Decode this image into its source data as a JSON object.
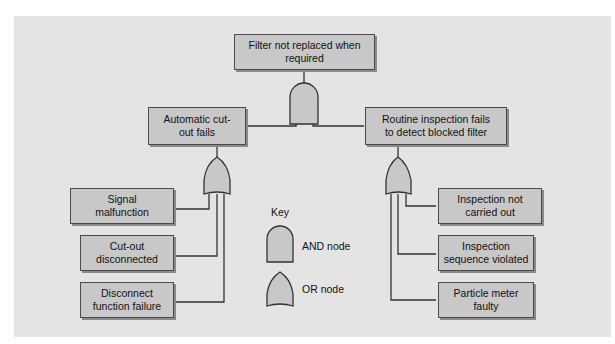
{
  "diagram": {
    "type": "fault-tree",
    "colors": {
      "background": "#e4e4e4",
      "node_fill": "#c8c8c8",
      "gate_fill": "#c8c8c8",
      "line": "#333333"
    },
    "top_event": {
      "label": "Filter not replaced when required",
      "line1": "Filter not replaced when",
      "line2": "required",
      "gate": "AND"
    },
    "intermediate_events": [
      {
        "label": "Automatic cut-out fails",
        "line1": "Automatic cut-",
        "line2": "out fails",
        "gate": "OR",
        "children": [
          {
            "label": "Signal malfunction",
            "line1": "Signal",
            "line2": "malfunction"
          },
          {
            "label": "Cut-out disconnected",
            "line1": "Cut-out",
            "line2": "disconnected"
          },
          {
            "label": "Disconnect function failure",
            "line1": "Disconnect",
            "line2": "function failure"
          }
        ]
      },
      {
        "label": "Routine inspection fails to detect blocked filter",
        "line1": "Routine inspection fails",
        "line2": "to detect blocked filter",
        "gate": "OR",
        "children": [
          {
            "label": "Inspection not carried out",
            "line1": "Inspection not",
            "line2": "carried out"
          },
          {
            "label": "Inspection sequence violated",
            "line1": "Inspection",
            "line2": "sequence violated"
          },
          {
            "label": "Particle meter faulty",
            "line1": "Particle meter",
            "line2": "faulty"
          }
        ]
      }
    ],
    "key": {
      "title": "Key",
      "and_label": "AND node",
      "or_label": "OR node"
    }
  }
}
